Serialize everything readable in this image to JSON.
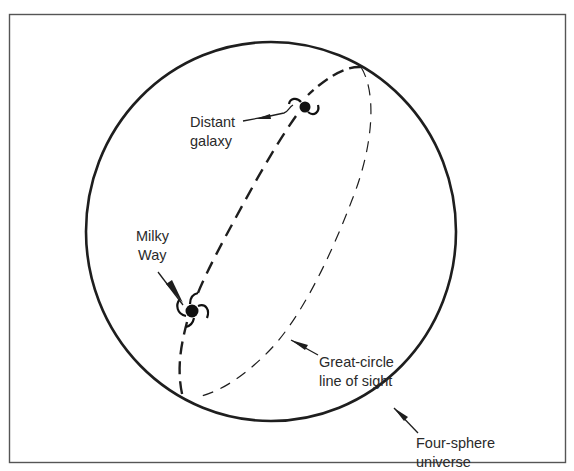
{
  "diagram": {
    "type": "four-sphere universe illustration",
    "colors": {
      "background": "#ffffff",
      "ink": "#1e1e1e",
      "frame": "#555555",
      "text": "#2a2a2a"
    },
    "labels": {
      "distant_galaxy": {
        "line1": "Distant",
        "line2": "galaxy"
      },
      "milky_way": {
        "line1": "Milky",
        "line2": "Way"
      },
      "great_circle": {
        "line1": "Great-circle",
        "line2": "line of sight"
      },
      "four_sphere": {
        "line1": "Four-sphere",
        "line2": "universe"
      }
    },
    "elements": {
      "sphere": "solid outline circle representing the universe",
      "front_path": "thick dashed great-circle arc (near side)",
      "back_path": "thin dashed great-circle arc (far side)",
      "galaxies": [
        "distant-galaxy-icon",
        "milky-way-icon"
      ]
    }
  }
}
